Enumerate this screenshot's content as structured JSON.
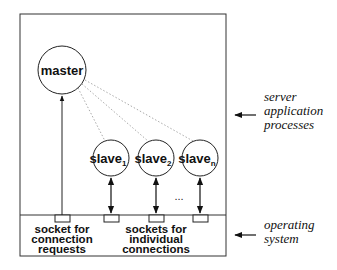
{
  "diagram": {
    "nodes": {
      "master": {
        "label": "master"
      },
      "slaves": [
        {
          "label": "slave",
          "subscript": "1"
        },
        {
          "label": "slave",
          "subscript": "2"
        },
        {
          "label": "slave",
          "subscript": "n"
        }
      ]
    },
    "ellipsis": "...",
    "socket_labels": {
      "connection": [
        "socket for",
        "connection",
        "requests"
      ],
      "individual": [
        "sockets for",
        "individual",
        "connections"
      ]
    },
    "side_labels": {
      "server": [
        "server",
        "application",
        "processes"
      ],
      "os": [
        "operating",
        "system"
      ]
    }
  }
}
